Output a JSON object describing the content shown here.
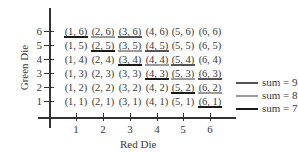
{
  "diagram": {
    "y_axis_title": "Green Die",
    "x_axis_title": "Red Die",
    "y_ticks": [
      "1",
      "2",
      "3",
      "4",
      "5",
      "6"
    ],
    "x_ticks": [
      "1",
      "2",
      "3",
      "4",
      "5",
      "6"
    ],
    "grid": [
      [
        "(1, 6)",
        "(2, 6)",
        "(3, 6)",
        "(4, 6)",
        "(5, 6)",
        "(6, 6)"
      ],
      [
        "(1, 5)",
        "(2, 5)",
        "(3, 5)",
        "(4, 5)",
        "(5, 5)",
        "(6, 5)"
      ],
      [
        "(1, 4)",
        "(2, 4)",
        "(3, 4)",
        "(4, 4)",
        "(5, 4)",
        "(6, 4)"
      ],
      [
        "(1, 3)",
        "(2, 3)",
        "(3, 3)",
        "(4, 3)",
        "(5, 3)",
        "(6, 3)"
      ],
      [
        "(1, 2)",
        "(2, 2)",
        "(3, 2)",
        "(4, 2)",
        "(5, 2)",
        "(6, 2)"
      ],
      [
        "(1, 1)",
        "(2, 1)",
        "(3, 1)",
        "(4, 1)",
        "(5, 1)",
        "(6, 1)"
      ]
    ],
    "legend": [
      {
        "label": "sum = 9",
        "color": "#555555"
      },
      {
        "label": "sum = 8",
        "color": "#9a9a9a"
      },
      {
        "label": "sum = 7",
        "color": "#1a1a1a"
      }
    ],
    "colors": {
      "sum9": "#555555",
      "sum8": "#9a9a9a",
      "sum7": "#1a1a1a"
    }
  }
}
